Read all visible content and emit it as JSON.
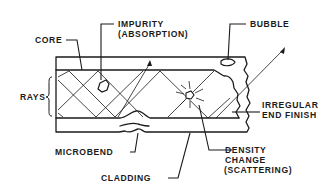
{
  "diagram": {
    "labels": {
      "core": "CORE",
      "impurity_line1": "IMPURITY",
      "impurity_line2": "(ABSORPTION)",
      "bubble": "BUBBLE",
      "rays": "RAYS",
      "irregular_line1": "IRREGULAR",
      "irregular_line2": "END FINISH",
      "microbend": "MICROBEND",
      "density_line1": "DENSITY",
      "density_line2": "CHANGE",
      "density_line3": "(SCATTERING)",
      "cladding": "CLADDING"
    },
    "colors": {
      "ink": "#1a1a1a",
      "background": "#ffffff"
    }
  }
}
